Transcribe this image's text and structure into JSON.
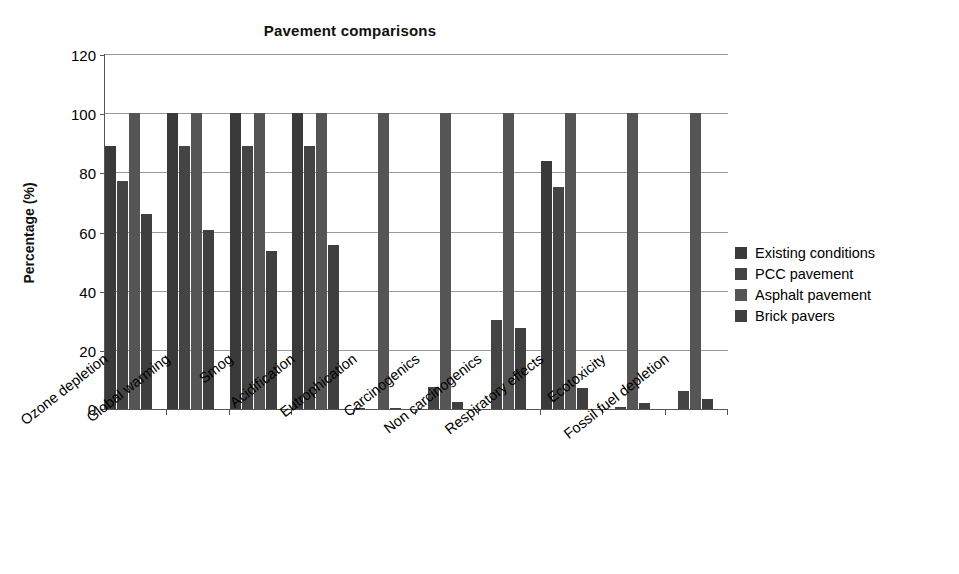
{
  "chart_data": {
    "type": "bar",
    "title": "Pavement comparisons",
    "xlabel": "",
    "ylabel": "Percentage (%)",
    "ylim": [
      0,
      120
    ],
    "ytick_step": 20,
    "yticks": [
      0,
      20,
      40,
      60,
      80,
      100,
      120
    ],
    "grid": true,
    "legend_position": "right",
    "categories": [
      "Ozone depletion",
      "Global warming",
      "Smog",
      "Acidification",
      "Eutrophication",
      "Carcinogenics",
      "Non carcinogenics",
      "Respiratory effects",
      "Ecotoxicity",
      "Fossil fuel depletion"
    ],
    "series": [
      {
        "name": "Existing conditions",
        "color": "#3a3a3a",
        "values": [
          89,
          100,
          100,
          100,
          0.5,
          0,
          0,
          84,
          0,
          0
        ]
      },
      {
        "name": "PCC pavement",
        "color": "#444444",
        "values": [
          77,
          89,
          89,
          89,
          0,
          7.5,
          30,
          75,
          0.7,
          6
        ]
      },
      {
        "name": "Asphalt pavement",
        "color": "#555555",
        "values": [
          100,
          100,
          100,
          100,
          100,
          100,
          100,
          100,
          100,
          100
        ]
      },
      {
        "name": "Brick pavers",
        "color": "#3f3f3f",
        "values": [
          66,
          60.5,
          53.5,
          55.5,
          0.5,
          2.5,
          27.5,
          7,
          2,
          3.5
        ]
      }
    ]
  }
}
